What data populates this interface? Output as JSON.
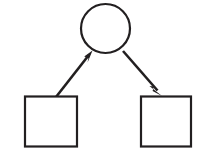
{
  "canvas": {
    "width": 210,
    "height": 157,
    "background_color": "#ffffff",
    "title": "Node and arrow diagram"
  },
  "style": {
    "stroke_color": "#221f20",
    "fill_color": "#ffffff",
    "node_stroke_width": 2.2,
    "edge_stroke_width": 2.6
  },
  "nodes": [
    {
      "id": "circle-node",
      "name": "circle-node",
      "shape": "circle",
      "label": "",
      "cx": 105.5,
      "cy": 28.5,
      "r": 24.5,
      "stroke_color": "#221f20",
      "fill_color": "#ffffff"
    },
    {
      "id": "left-square-node",
      "name": "left-square-node",
      "shape": "square",
      "label": "",
      "x": 25,
      "y": 96.5,
      "width": 52,
      "height": 50,
      "stroke_color": "#221f20",
      "fill_color": "#ffffff"
    },
    {
      "id": "right-square-node",
      "name": "right-square-node",
      "shape": "square",
      "label": "",
      "x": 141,
      "y": 96.5,
      "width": 50,
      "height": 50,
      "stroke_color": "#221f20",
      "fill_color": "#ffffff"
    }
  ],
  "edges": [
    {
      "id": "edge-left-square-to-circle",
      "name": "edge-left-square-to-circle",
      "label": "",
      "from": "left-square-node",
      "to": "circle-node",
      "direction": "up-right",
      "arrowhead": "end",
      "tail_x": 56,
      "tail_y": 97,
      "tip_x": 92.5,
      "tip_y": 50.5,
      "stroke_color": "#221f20"
    },
    {
      "id": "edge-circle-to-right-square",
      "name": "edge-circle-to-right-square",
      "label": "",
      "from": "circle-node",
      "to": "right-square-node",
      "direction": "down-right",
      "arrowhead": "end",
      "tail_x": 123,
      "tail_y": 51,
      "tip_x": 162,
      "tip_y": 96,
      "stroke_color": "#221f20"
    }
  ]
}
